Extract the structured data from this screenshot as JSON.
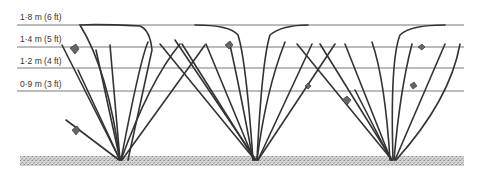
{
  "diagram": {
    "wires": [
      {
        "label": "1·8 m (6 ft)",
        "y": 25,
        "label_y": 12
      },
      {
        "label": "1·4 m (5 ft)",
        "y": 47,
        "label_y": 34
      },
      {
        "label": "1·2 m (4 ft)",
        "y": 68,
        "label_y": 56
      },
      {
        "label": "0·9 m (3 ft)",
        "y": 91,
        "label_y": 79
      }
    ],
    "ground": {
      "x1": 20,
      "x2": 464,
      "y1": 156,
      "y2": 166
    },
    "plants": [
      {
        "name": "left-plant",
        "base_x": 120
      },
      {
        "name": "middle-plant",
        "base_x": 255
      },
      {
        "name": "right-plant",
        "base_x": 392
      }
    ],
    "colors": {
      "line": "#444444",
      "ground": "#bdbdbd",
      "cane": "#333333"
    }
  }
}
